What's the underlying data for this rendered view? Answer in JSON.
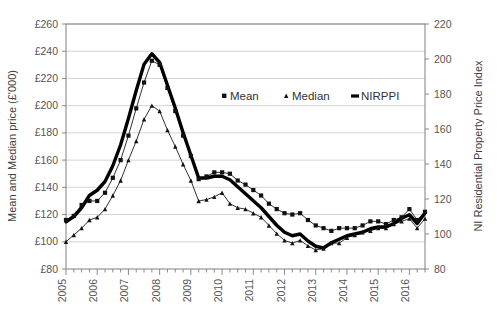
{
  "chart_data": {
    "type": "line",
    "title": "",
    "xlabel": "",
    "ylabel": "Mean and Median price (£'000)",
    "y2label": "NI Residential Property Price Index",
    "ylim": [
      80,
      260
    ],
    "y2lim": [
      80,
      220
    ],
    "ytick_labels": [
      "£80",
      "£100",
      "£120",
      "£140",
      "£160",
      "£180",
      "£200",
      "£220",
      "£240",
      "£260"
    ],
    "ytick_values": [
      80,
      100,
      120,
      140,
      160,
      180,
      200,
      220,
      240,
      260
    ],
    "y2tick_labels": [
      "80",
      "100",
      "120",
      "140",
      "160",
      "180",
      "200",
      "220"
    ],
    "y2tick_values": [
      80,
      100,
      120,
      140,
      160,
      180,
      200,
      220
    ],
    "xtick_labels": [
      "2005",
      "2006",
      "2007",
      "2008",
      "2009",
      "2010",
      "2011",
      "2012",
      "2013",
      "2014",
      "2015",
      "2016"
    ],
    "x_start_year": 2005,
    "x_quarters_total": 47,
    "grid": "horizontal",
    "legend_position": "inside-top-right",
    "series": [
      {
        "name": "Mean",
        "axis": "left",
        "unit": "£'000",
        "marker": "square",
        "values": [
          116,
          119,
          127,
          130,
          130,
          136,
          147,
          160,
          178,
          198,
          217,
          233,
          230,
          213,
          196,
          178,
          163,
          146,
          148,
          151,
          151,
          150,
          145,
          142,
          138,
          134,
          128,
          124,
          121,
          120,
          121,
          116,
          112,
          110,
          108,
          110,
          110,
          110,
          112,
          115,
          115,
          113,
          116,
          118,
          124,
          116,
          122
        ]
      },
      {
        "name": "Median",
        "axis": "left",
        "unit": "£'000",
        "marker": "triangle",
        "values": [
          100,
          105,
          110,
          116,
          118,
          124,
          134,
          145,
          160,
          174,
          190,
          200,
          196,
          182,
          170,
          157,
          145,
          130,
          131,
          133,
          136,
          128,
          125,
          124,
          121,
          118,
          112,
          106,
          101,
          99,
          101,
          97,
          94,
          95,
          99,
          99,
          103,
          105,
          107,
          108,
          110,
          110,
          113,
          115,
          117,
          110,
          117
        ]
      },
      {
        "name": "NIRPPI",
        "axis": "right",
        "unit": "index",
        "marker": "none",
        "values": [
          107,
          110,
          115,
          122,
          125,
          130,
          139,
          151,
          166,
          182,
          197,
          203,
          198,
          185,
          172,
          158,
          145,
          132,
          132,
          133,
          133,
          131,
          127,
          123,
          119,
          115,
          110,
          105,
          101,
          99,
          100,
          96,
          93,
          92,
          95,
          97,
          99,
          100,
          101,
          103,
          104,
          104,
          106,
          109,
          111,
          106,
          112
        ]
      }
    ],
    "legend": [
      {
        "label": "Mean",
        "marker": "square"
      },
      {
        "label": "Median",
        "marker": "triangle-small"
      },
      {
        "label": "NIRPPI",
        "marker": "thick-line"
      }
    ],
    "colors": {
      "series_line": "#1a1a1a",
      "nirppi_line": "#000000",
      "gridline": "#c8c8c8",
      "axis": "#808080",
      "text": "#555555"
    }
  }
}
